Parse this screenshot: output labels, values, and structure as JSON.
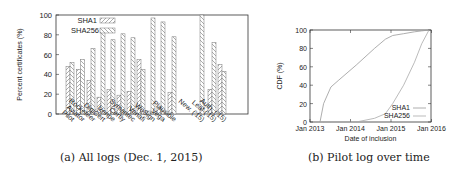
{
  "chart_data": [
    {
      "type": "bar",
      "title": "",
      "caption": "(a) All logs (Dec. 1, 2015)",
      "xlabel": "",
      "ylabel": "Percent certificates (%)",
      "ylim": [
        0,
        100
      ],
      "yticks": [
        0,
        20,
        40,
        60,
        80,
        100
      ],
      "categories": [
        "Pilot",
        "Aviator",
        "Rocketeer",
        "DigiCert",
        "Izenpe",
        "Certly",
        "Symantec",
        "Venafi",
        "WoSign",
        "Vega",
        "Plausible",
        "New. ('15)",
        "Leaf ('15)",
        "Auth. ('15)"
      ],
      "series": [
        {
          "name": "SHA1",
          "values": [
            48,
            45,
            34,
            17,
            25,
            19,
            23,
            55,
            3,
            7,
            22,
            0,
            25,
            50
          ]
        },
        {
          "name": "SHA256",
          "values": [
            52,
            55,
            66,
            83,
            75,
            81,
            77,
            45,
            97,
            93,
            78,
            100,
            72,
            43
          ]
        }
      ],
      "legend_position": "top-left"
    },
    {
      "type": "line",
      "title": "",
      "caption": "(b) Pilot log over time",
      "xlabel": "Date of inclusion",
      "ylabel": "CDF (%)",
      "ylim": [
        0,
        100
      ],
      "yticks": [
        0,
        20,
        40,
        60,
        80,
        100
      ],
      "xticks": [
        "Jan 2013",
        "Jan 2014",
        "Jan 2015",
        "Jan 2016"
      ],
      "x": [
        0,
        0.1,
        0.3,
        0.5,
        1.0,
        1.5,
        1.8,
        2.0,
        2.3,
        2.6,
        2.8,
        3.0
      ],
      "series": [
        {
          "name": "SHA1",
          "values": [
            0,
            20,
            38,
            45,
            62,
            80,
            90,
            94,
            96,
            98,
            99,
            100
          ]
        },
        {
          "name": "SHA256",
          "values": [
            0,
            0,
            0,
            0,
            0,
            4,
            9,
            20,
            40,
            65,
            85,
            100
          ]
        }
      ],
      "legend_position": "bottom-right"
    }
  ]
}
